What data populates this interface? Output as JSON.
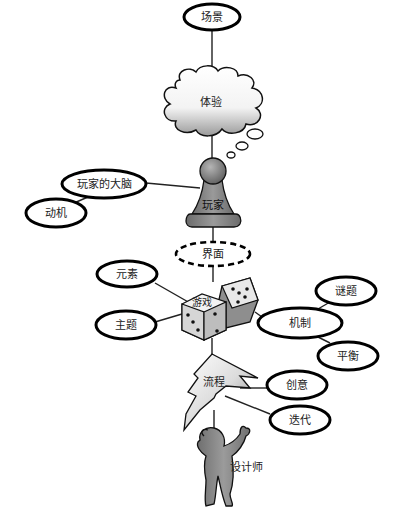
{
  "diagram": {
    "title": "",
    "nodes": [
      {
        "id": "scene",
        "label": "场景",
        "shape": "ellipse"
      },
      {
        "id": "experience",
        "label": "体验",
        "shape": "cloud"
      },
      {
        "id": "player",
        "label": "玩家",
        "shape": "pawn"
      },
      {
        "id": "player_mind",
        "label": "玩家的大脑",
        "shape": "ellipse"
      },
      {
        "id": "motivation",
        "label": "动机",
        "shape": "ellipse"
      },
      {
        "id": "interface",
        "label": "界面",
        "shape": "dashed-ellipse"
      },
      {
        "id": "game",
        "label": "游戏",
        "shape": "dice"
      },
      {
        "id": "elements",
        "label": "元素",
        "shape": "ellipse"
      },
      {
        "id": "theme",
        "label": "主题",
        "shape": "ellipse"
      },
      {
        "id": "mechanics",
        "label": "机制",
        "shape": "ellipse"
      },
      {
        "id": "puzzles",
        "label": "谜题",
        "shape": "ellipse"
      },
      {
        "id": "balance",
        "label": "平衡",
        "shape": "ellipse"
      },
      {
        "id": "process",
        "label": "流程",
        "shape": "lightning"
      },
      {
        "id": "creativity",
        "label": "创意",
        "shape": "ellipse"
      },
      {
        "id": "iteration",
        "label": "迭代",
        "shape": "ellipse"
      },
      {
        "id": "designer",
        "label": "设计师",
        "shape": "person"
      }
    ],
    "edges": [
      [
        "scene",
        "experience"
      ],
      [
        "experience",
        "player"
      ],
      [
        "player",
        "player_mind"
      ],
      [
        "player_mind",
        "motivation"
      ],
      [
        "player",
        "interface"
      ],
      [
        "interface",
        "game"
      ],
      [
        "game",
        "elements"
      ],
      [
        "game",
        "theme"
      ],
      [
        "game",
        "mechanics"
      ],
      [
        "mechanics",
        "puzzles"
      ],
      [
        "mechanics",
        "balance"
      ],
      [
        "game",
        "process"
      ],
      [
        "process",
        "creativity"
      ],
      [
        "process",
        "iteration"
      ],
      [
        "process",
        "designer"
      ]
    ],
    "colors": {
      "outline": "#000000",
      "fill_gray": "#8a8a8a",
      "fill_white": "#ffffff"
    }
  }
}
